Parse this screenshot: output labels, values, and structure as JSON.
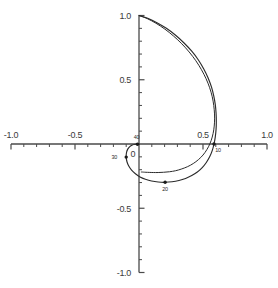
{
  "chart_data": {
    "type": "line",
    "title": "",
    "subtitle": "",
    "xlabel": "",
    "ylabel": "",
    "xlim": [
      -1.0,
      1.0
    ],
    "ylim": [
      -1.0,
      1.0
    ],
    "grid": false,
    "legend_position": "none",
    "x_ticks": [
      -1.0,
      -0.5,
      0.0,
      0.5,
      1.0
    ],
    "y_ticks": [
      -1.0,
      -0.5,
      0.0,
      0.5,
      1.0
    ],
    "x_tick_labels": [
      "-1.0",
      "-0.5",
      "0",
      "0.5",
      "1.0"
    ],
    "y_tick_labels": [
      "-1.0",
      "-0.5",
      "0",
      "0.5",
      "1.0"
    ],
    "minor_tick_step": 0.1,
    "origin_label": "0",
    "series": [
      {
        "name": "outer-curve",
        "marked": true,
        "x": [
          0.0,
          0.068,
          0.14,
          0.214,
          0.286,
          0.352,
          0.412,
          0.464,
          0.506,
          0.54,
          0.566,
          0.584,
          0.596,
          0.602,
          0.604,
          0.602,
          0.596,
          0.586,
          0.572,
          0.552,
          0.526,
          0.494,
          0.456,
          0.412,
          0.364,
          0.312,
          0.258,
          0.204,
          0.15,
          0.098,
          0.05,
          0.008,
          -0.028,
          -0.058,
          -0.08,
          -0.094,
          -0.1,
          -0.098,
          -0.088,
          -0.072,
          -0.052,
          -0.03,
          -0.012,
          0.0
        ],
        "y": [
          1.0,
          0.978,
          0.944,
          0.9,
          0.846,
          0.786,
          0.722,
          0.654,
          0.584,
          0.514,
          0.444,
          0.374,
          0.306,
          0.24,
          0.176,
          0.114,
          0.056,
          0.0,
          -0.052,
          -0.1,
          -0.144,
          -0.184,
          -0.218,
          -0.246,
          -0.268,
          -0.284,
          -0.294,
          -0.298,
          -0.296,
          -0.288,
          -0.274,
          -0.256,
          -0.232,
          -0.204,
          -0.172,
          -0.138,
          -0.102,
          -0.068,
          -0.04,
          -0.02,
          -0.008,
          -0.002,
          -0.0,
          0.0
        ]
      },
      {
        "name": "inner-curve",
        "marked": false,
        "x": [
          0.0,
          0.064,
          0.132,
          0.202,
          0.27,
          0.334,
          0.392,
          0.444,
          0.488,
          0.524,
          0.552,
          0.572,
          0.584,
          0.59,
          0.59,
          0.584,
          0.572,
          0.554,
          0.53,
          0.5,
          0.464,
          0.424,
          0.38,
          0.334,
          0.286,
          0.238,
          0.192,
          0.15,
          0.112,
          0.08,
          0.054,
          0.036,
          0.024,
          0.018
        ],
        "y": [
          1.0,
          0.976,
          0.94,
          0.894,
          0.84,
          0.78,
          0.716,
          0.648,
          0.578,
          0.508,
          0.438,
          0.368,
          0.3,
          0.234,
          0.17,
          0.11,
          0.054,
          0.002,
          -0.044,
          -0.086,
          -0.122,
          -0.152,
          -0.176,
          -0.194,
          -0.208,
          -0.216,
          -0.22,
          -0.222,
          -0.222,
          -0.221,
          -0.22,
          -0.219,
          -0.218,
          -0.218
        ]
      }
    ],
    "point_markers": [
      {
        "label": "10",
        "x": 0.586,
        "y": 0.0,
        "label_dx": 4,
        "label_dy": 8
      },
      {
        "label": "20",
        "x": 0.204,
        "y": -0.298,
        "label_dx": 0,
        "label_dy": 9
      },
      {
        "label": "30",
        "x": -0.1,
        "y": -0.102,
        "label_dx": -12,
        "label_dy": 2
      },
      {
        "label": "40",
        "x": -0.012,
        "y": -0.002,
        "label_dx": -1,
        "label_dy": -5
      }
    ]
  },
  "colors": {
    "axis": "#4a4a4a",
    "curve": "#2b2b2b",
    "marker": "#1a1a1a",
    "background": "#ffffff",
    "text": "#3a3a3a"
  }
}
